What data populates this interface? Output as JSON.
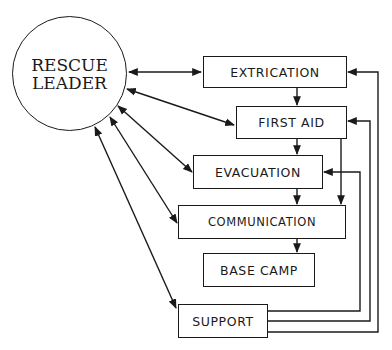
{
  "diagram": {
    "type": "flowchart",
    "central_node": {
      "line1": "RESCUE",
      "line2": "LEADER"
    },
    "nodes": [
      {
        "id": "extrication",
        "label": "EXTRICATION"
      },
      {
        "id": "first_aid",
        "label": "FIRST AID"
      },
      {
        "id": "evacuation",
        "label": "EVACUATION"
      },
      {
        "id": "communication",
        "label": "COMMUNICATION"
      },
      {
        "id": "base_camp",
        "label": "BASE CAMP"
      },
      {
        "id": "support",
        "label": "SUPPORT"
      }
    ],
    "edges": [
      {
        "from": "rescue_leader",
        "to": "extrication",
        "bidirectional": true
      },
      {
        "from": "rescue_leader",
        "to": "first_aid",
        "bidirectional": true
      },
      {
        "from": "rescue_leader",
        "to": "evacuation",
        "bidirectional": true
      },
      {
        "from": "rescue_leader",
        "to": "communication",
        "bidirectional": true
      },
      {
        "from": "rescue_leader",
        "to": "support",
        "bidirectional": true
      },
      {
        "from": "extrication",
        "to": "first_aid"
      },
      {
        "from": "first_aid",
        "to": "evacuation"
      },
      {
        "from": "first_aid",
        "to": "communication"
      },
      {
        "from": "evacuation",
        "to": "communication"
      },
      {
        "from": "communication",
        "to": "base_camp"
      },
      {
        "from": "support",
        "to": "extrication"
      },
      {
        "from": "support",
        "to": "first_aid"
      },
      {
        "from": "support",
        "to": "evacuation"
      }
    ],
    "colors": {
      "stroke": "#1a1a1a",
      "background": "#ffffff"
    }
  }
}
